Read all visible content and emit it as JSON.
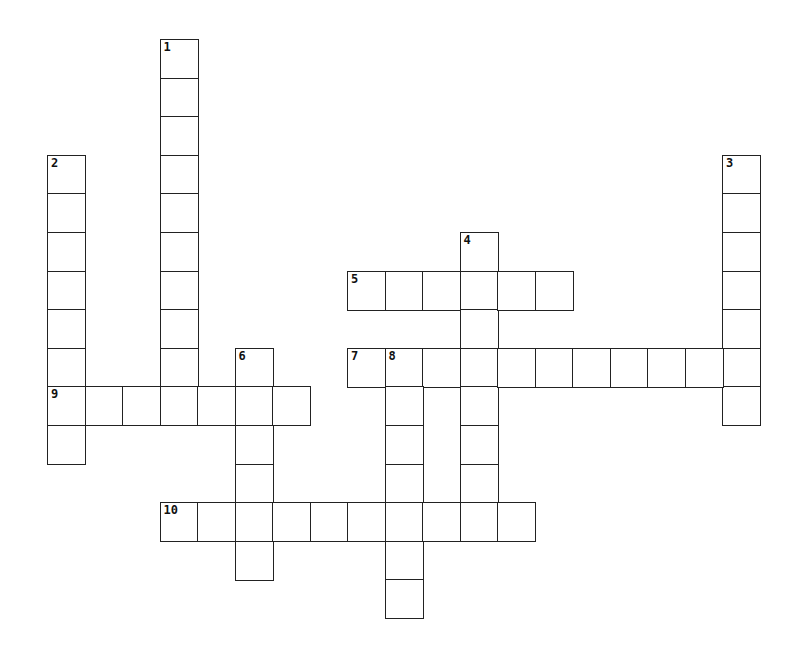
{
  "puzzle": {
    "type": "crossword",
    "grid_origin": {
      "x": 47,
      "y": 39
    },
    "cell_size": {
      "w": 37.5,
      "h": 38.6
    },
    "line_color": "#222222",
    "entries": [
      {
        "number": "1",
        "direction": "down",
        "col": 3,
        "row": 0,
        "length": 10
      },
      {
        "number": "2",
        "direction": "down",
        "col": 0,
        "row": 3,
        "length": 8
      },
      {
        "number": "3",
        "direction": "down",
        "col": 18,
        "row": 3,
        "length": 7
      },
      {
        "number": "4",
        "direction": "down",
        "col": 11,
        "row": 5,
        "length": 8
      },
      {
        "number": "5",
        "direction": "across",
        "col": 8,
        "row": 6,
        "length": 6
      },
      {
        "number": "6",
        "direction": "down",
        "col": 5,
        "row": 8,
        "length": 6
      },
      {
        "number": "7",
        "direction": "across",
        "col": 8,
        "row": 8,
        "length": 11
      },
      {
        "number": "8",
        "direction": "down",
        "col": 9,
        "row": 8,
        "length": 7
      },
      {
        "number": "9",
        "direction": "across",
        "col": 0,
        "row": 9,
        "length": 7
      },
      {
        "number": "10",
        "direction": "across",
        "col": 3,
        "row": 12,
        "length": 10
      }
    ]
  }
}
